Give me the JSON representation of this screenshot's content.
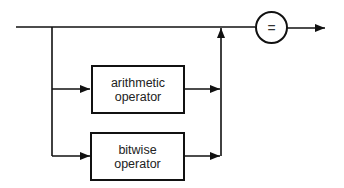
{
  "diagram": {
    "type": "syntax-diagram",
    "boxes": [
      {
        "id": "arithmetic",
        "line1": "arithmetic",
        "line2": "operator"
      },
      {
        "id": "bitwise",
        "line1": "bitwise",
        "line2": "operator"
      }
    ],
    "terminal": {
      "symbol": "="
    },
    "colors": {
      "stroke": "#111111",
      "background": "#ffffff",
      "text": "#222222"
    }
  }
}
